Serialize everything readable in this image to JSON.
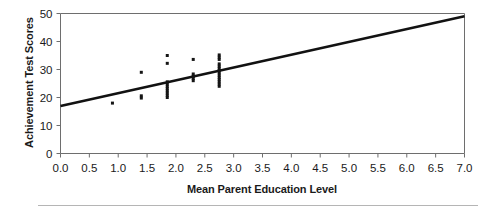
{
  "chart_data": {
    "type": "scatter",
    "title": "",
    "xlabel": "Mean Parent Education Level",
    "ylabel": "Achievement Test Scores",
    "xlim": [
      0.0,
      7.0
    ],
    "ylim": [
      0,
      50
    ],
    "xticks": [
      0.0,
      0.5,
      1.0,
      1.5,
      2.0,
      2.5,
      3.0,
      3.5,
      4.0,
      4.5,
      5.0,
      5.5,
      6.0,
      6.5,
      7.0
    ],
    "xtick_labels": [
      "0.0",
      "0.5",
      "1.0",
      "1.5",
      "2.0",
      "2.5",
      "3.0",
      "3.5",
      "4.0",
      "4.5",
      "5.0",
      "5.5",
      "6.0",
      "6.5",
      "7.0"
    ],
    "yticks": [
      0,
      10,
      20,
      30,
      40,
      50
    ],
    "ytick_labels": [
      "0",
      "10",
      "20",
      "30",
      "40",
      "50"
    ],
    "grid": false,
    "legend": false,
    "legend_position": "none",
    "series": [
      {
        "name": "Students",
        "marker": "square",
        "color": "#151515",
        "points": [
          [
            0.9,
            18.0
          ],
          [
            1.4,
            19.8
          ],
          [
            1.4,
            20.6
          ],
          [
            1.4,
            29.0
          ],
          [
            1.85,
            20.0
          ],
          [
            1.85,
            20.8
          ],
          [
            1.85,
            21.6
          ],
          [
            1.85,
            22.4
          ],
          [
            1.85,
            23.2
          ],
          [
            1.85,
            24.0
          ],
          [
            1.85,
            24.8
          ],
          [
            1.85,
            25.6
          ],
          [
            1.85,
            32.2
          ],
          [
            1.85,
            35.0
          ],
          [
            2.3,
            26.0
          ],
          [
            2.3,
            26.8
          ],
          [
            2.3,
            27.6
          ],
          [
            2.3,
            28.4
          ],
          [
            2.3,
            33.6
          ],
          [
            2.75,
            24.0
          ],
          [
            2.75,
            24.8
          ],
          [
            2.75,
            25.6
          ],
          [
            2.75,
            26.4
          ],
          [
            2.75,
            27.2
          ],
          [
            2.75,
            28.0
          ],
          [
            2.75,
            28.8
          ],
          [
            2.75,
            29.6
          ],
          [
            2.75,
            30.4
          ],
          [
            2.75,
            31.2
          ],
          [
            2.75,
            32.0
          ],
          [
            2.75,
            33.6
          ],
          [
            2.75,
            34.4
          ],
          [
            2.75,
            35.2
          ]
        ]
      }
    ],
    "trendline": {
      "name": "Regression line",
      "color": "#121212",
      "x_start": 0.0,
      "y_start": 17.0,
      "x_end": 7.0,
      "y_end": 49.0,
      "slope": 4.571,
      "intercept": 17.0
    }
  },
  "figure": {
    "background_color": "#ffffff",
    "axis_color": "#6e6e6e",
    "marker_color": "#151515",
    "rule_color": "#b5b5b5"
  }
}
